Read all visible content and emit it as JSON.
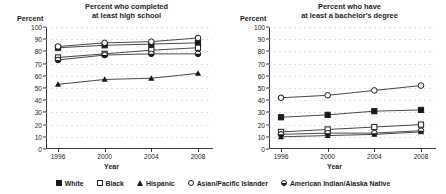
{
  "chart_data": [
    {
      "type": "line",
      "panel_id": "high-school",
      "title": "Percent who completed\nat least high school",
      "title_line1": "Percent who completed",
      "title_line2": "at least high school",
      "ylabel": "Percent",
      "xlabel": "Year",
      "x": [
        1996,
        2000,
        2004,
        2008
      ],
      "xticklabels": [
        "1996",
        "2000",
        "2004",
        "2008"
      ],
      "ylim": [
        0,
        100
      ],
      "yticks": [
        0,
        10,
        20,
        30,
        40,
        50,
        60,
        70,
        80,
        90,
        100
      ],
      "yticklabels": [
        "0",
        "10",
        "20",
        "30",
        "40",
        "50",
        "60",
        "70",
        "80",
        "90",
        "100"
      ],
      "grid": true,
      "legend_position": "bottom-figure",
      "series": [
        {
          "name": "White",
          "marker": "filled-square",
          "values": [
            83,
            85,
            86,
            87
          ]
        },
        {
          "name": "Black",
          "marker": "open-square",
          "values": [
            75,
            78,
            81,
            83
          ]
        },
        {
          "name": "Hispanic",
          "marker": "filled-triangle",
          "values": [
            53,
            57,
            58,
            62
          ]
        },
        {
          "name": "Asian/Pacific Islander",
          "marker": "open-circle",
          "values": [
            84,
            87,
            88,
            91
          ]
        },
        {
          "name": "American Indian/Alaska Native",
          "marker": "half-circle",
          "values": [
            73,
            77,
            78,
            78
          ]
        }
      ]
    },
    {
      "type": "line",
      "panel_id": "bachelors-degree",
      "title": "Percent who have\nat least a bachelor's degree",
      "title_line1": "Percent who have",
      "title_line2": "at least a bachelor's degree",
      "ylabel": "Percent",
      "xlabel": "Year",
      "x": [
        1996,
        2000,
        2004,
        2008
      ],
      "xticklabels": [
        "1996",
        "2000",
        "2004",
        "2008"
      ],
      "ylim": [
        0,
        100
      ],
      "yticks": [
        0,
        10,
        20,
        30,
        40,
        50,
        60,
        70,
        80,
        90,
        100
      ],
      "yticklabels": [
        "0",
        "10",
        "20",
        "30",
        "40",
        "50",
        "60",
        "70",
        "80",
        "90",
        "100"
      ],
      "grid": true,
      "legend_position": "bottom-figure",
      "series": [
        {
          "name": "White",
          "marker": "filled-square",
          "values": [
            26,
            28,
            31,
            32
          ]
        },
        {
          "name": "Black",
          "marker": "open-square",
          "values": [
            14,
            16,
            18,
            20
          ]
        },
        {
          "name": "Hispanic",
          "marker": "filled-triangle",
          "values": [
            10,
            11,
            12,
            14
          ]
        },
        {
          "name": "Asian/Pacific Islander",
          "marker": "open-circle",
          "values": [
            42,
            44,
            48,
            52
          ]
        },
        {
          "name": "American Indian/Alaska Native",
          "marker": "half-circle",
          "values": [
            12,
            13,
            13,
            15
          ]
        }
      ]
    }
  ],
  "legend": {
    "items": [
      {
        "label": "White",
        "marker": "filled-square"
      },
      {
        "label": "Black",
        "marker": "open-square"
      },
      {
        "label": "Hispanic",
        "marker": "filled-triangle"
      },
      {
        "label": "Asian/Pacific Islander",
        "marker": "open-circle"
      },
      {
        "label": "American Indian/Alaska Native",
        "marker": "half-circle"
      }
    ]
  },
  "colors": {
    "ink": "#1a1a1a",
    "axis": "#3a3a3a",
    "grid": "#c9c9c9",
    "background": "#ffffff"
  }
}
